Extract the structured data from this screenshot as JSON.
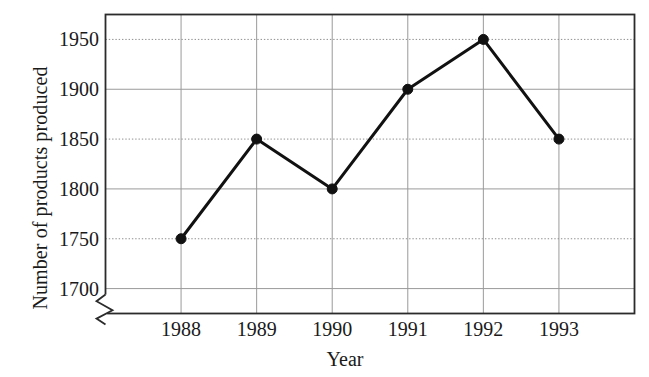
{
  "chart_data": {
    "type": "line",
    "title": "",
    "xlabel": "Year",
    "ylabel": "Number of products produced",
    "categories": [
      "1988",
      "1989",
      "1990",
      "1991",
      "1992",
      "1993"
    ],
    "values": [
      1750,
      1850,
      1800,
      1900,
      1950,
      1850
    ],
    "series": [
      {
        "name": "Number of products produced",
        "values": [
          1750,
          1850,
          1800,
          1900,
          1950,
          1850
        ]
      }
    ],
    "points": [
      {
        "x": "1988",
        "y": 1750
      },
      {
        "x": "1989",
        "y": 1850
      },
      {
        "x": "1990",
        "y": 1800
      },
      {
        "x": "1991",
        "y": 1900
      },
      {
        "x": "1992",
        "y": 1950
      },
      {
        "x": "1993",
        "y": 1850
      }
    ],
    "ylim": [
      1675,
      1975
    ],
    "y_ticks": [
      1700,
      1750,
      1800,
      1850,
      1900,
      1950
    ],
    "y_tick_labels": [
      "1700",
      "1750",
      "1800",
      "1850",
      "1900",
      "1950"
    ],
    "x_ticks": [
      "1988",
      "1989",
      "1990",
      "1991",
      "1992",
      "1993"
    ],
    "grid": true,
    "grid_style_solid_ticks": [
      1700,
      1800,
      1900
    ],
    "grid_style_dotted_ticks": [
      1750,
      1850,
      1950
    ],
    "x_grid": true,
    "legend": "none",
    "axis_break": true,
    "axis_break_label": "y-axis-break-zigzag",
    "colors": {
      "line": "#111111",
      "marker": "#111111",
      "grid": "#9a9a9a",
      "frame": "#2b2b2b",
      "background": "#ffffff",
      "text": "#1a1a1a"
    },
    "line_width": 3,
    "marker": "circle",
    "marker_size": 5
  },
  "axes": {
    "x_title": "Year",
    "y_title": "Number of products produced"
  }
}
